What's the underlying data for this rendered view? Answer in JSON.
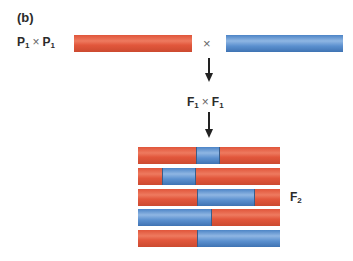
{
  "panel_label": "(b)",
  "parental": {
    "label_left": "P",
    "label_left_sub": "1",
    "cross_symbol": "×",
    "label_right": "P",
    "label_right_sub": "1",
    "chromosome_left_color": "red",
    "chromosome_right_color": "blue"
  },
  "f1": {
    "label_left": "F",
    "label_left_sub": "1",
    "cross_symbol": "×",
    "label_right": "F",
    "label_right_sub": "1"
  },
  "f2": {
    "label": "F",
    "label_sub": "2",
    "chromosomes": [
      {
        "segments": [
          {
            "color": "red",
            "width": 58
          },
          {
            "color": "blue",
            "width": 24
          },
          {
            "color": "red",
            "width": 60
          }
        ]
      },
      {
        "segments": [
          {
            "color": "red",
            "width": 24
          },
          {
            "color": "blue",
            "width": 34
          },
          {
            "color": "red",
            "width": 84
          }
        ]
      },
      {
        "segments": [
          {
            "color": "red",
            "width": 59
          },
          {
            "color": "blue",
            "width": 58
          },
          {
            "color": "red",
            "width": 25
          }
        ]
      },
      {
        "segments": [
          {
            "color": "blue",
            "width": 74
          },
          {
            "color": "red",
            "width": 68
          }
        ]
      },
      {
        "segments": [
          {
            "color": "red",
            "width": 59
          },
          {
            "color": "blue",
            "width": 83
          }
        ]
      }
    ]
  },
  "colors": {
    "red": "#e2583c",
    "blue": "#5b90cf"
  }
}
